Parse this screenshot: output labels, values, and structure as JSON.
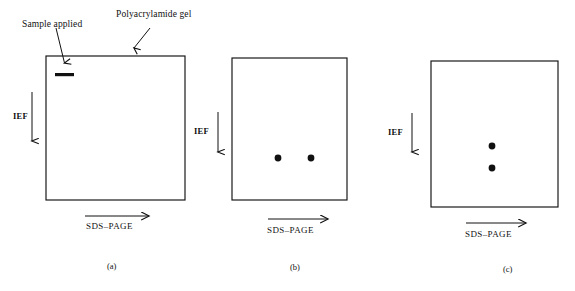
{
  "figure": {
    "background_color": "#ffffff",
    "ink_color": "#111111",
    "width": 575,
    "height": 291
  },
  "callouts": {
    "sample_applied": "Sample applied",
    "polyacrylamide_gel": "Polyacrylamide gel"
  },
  "panels": [
    {
      "id": "a",
      "caption": "(a)",
      "ief_label": "IEF",
      "sds_label": "SDS–PAGE",
      "gel": {
        "x": 46,
        "y": 56,
        "width": 139,
        "height": 144
      },
      "sample_band": {
        "x": 55,
        "y": 73,
        "width": 19,
        "height": 3
      },
      "spots": []
    },
    {
      "id": "b",
      "caption": "(b)",
      "ief_label": "IEF",
      "sds_label": "SDS–PAGE",
      "gel": {
        "x": 232,
        "y": 58,
        "width": 115,
        "height": 142
      },
      "sample_band": null,
      "spots": [
        {
          "cx": 278,
          "cy": 158,
          "r": 3.4
        },
        {
          "cx": 311,
          "cy": 158,
          "r": 3.4
        }
      ]
    },
    {
      "id": "c",
      "caption": "(c)",
      "ief_label": "IEF",
      "sds_label": "SDS–PAGE",
      "gel": {
        "x": 431,
        "y": 61,
        "width": 127,
        "height": 146
      },
      "sample_band": null,
      "spots": [
        {
          "cx": 492,
          "cy": 146,
          "r": 3.4
        },
        {
          "cx": 492,
          "cy": 168,
          "r": 3.4
        }
      ]
    }
  ],
  "icons": {
    "ief_arrow": "down-arrow-icon",
    "sds_arrow": "right-arrow-icon",
    "callout_arrow": "pointer-arrow-icon",
    "gel_outline": "rectangle-outline-icon",
    "sample_band": "band-icon",
    "protein_spot": "dot-icon"
  }
}
